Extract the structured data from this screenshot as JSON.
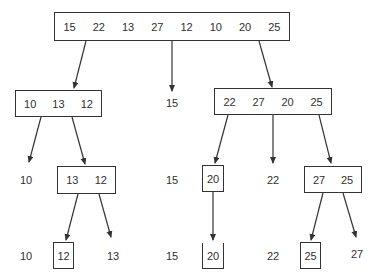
{
  "diagram": {
    "title": "",
    "root": {
      "values": [
        "15",
        "22",
        "13",
        "27",
        "12",
        "10",
        "20",
        "25"
      ]
    },
    "level1": {
      "left": {
        "values": [
          "10",
          "13",
          "12"
        ]
      },
      "pivot": "15",
      "right": {
        "values": [
          "22",
          "27",
          "20",
          "25"
        ]
      }
    },
    "level2": {
      "left_pivot": "10",
      "left_box": {
        "values": [
          "13",
          "12"
        ]
      },
      "center": "15",
      "right_box_small": {
        "values": [
          "20"
        ]
      },
      "right_pivot": "22",
      "right_box": {
        "values": [
          "27",
          "25"
        ]
      }
    },
    "level3": {
      "items": [
        {
          "value": "10",
          "boxed": false
        },
        {
          "value": "12",
          "boxed": true
        },
        {
          "value": "13",
          "boxed": false
        },
        {
          "value": "15",
          "boxed": false
        },
        {
          "value": "20",
          "boxed": "open-top"
        },
        {
          "value": "22",
          "boxed": false
        },
        {
          "value": "25",
          "boxed": true
        },
        {
          "value": "27",
          "boxed": false
        }
      ]
    }
  },
  "colors": {
    "line": "#333333",
    "text": "#2f2f2f",
    "background": "#ffffff"
  }
}
